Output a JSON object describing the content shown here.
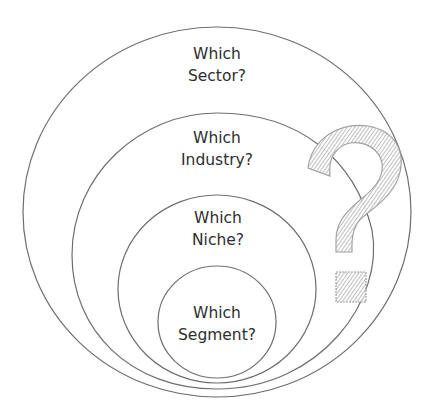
{
  "diagram": {
    "type": "nested-circles",
    "colors": {
      "stroke": "#6e6e6e",
      "text": "#2e2e2e",
      "question_mark": "#9a9a9a",
      "background": "#ffffff"
    },
    "levels": [
      {
        "name": "sector",
        "line1": "Which",
        "line2": "Sector?"
      },
      {
        "name": "industry",
        "line1": "Which",
        "line2": "Industry?"
      },
      {
        "name": "niche",
        "line1": "Which",
        "line2": "Niche?"
      },
      {
        "name": "segment",
        "line1": "Which",
        "line2": "Segment?"
      }
    ],
    "decoration": "question-mark"
  }
}
